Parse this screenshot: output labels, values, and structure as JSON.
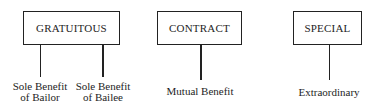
{
  "categories": [
    {
      "title": "GRATUITOUS",
      "branches": [
        {
          "line1": "Sole Benefit",
          "line2": "of Bailor"
        },
        {
          "line1": "Sole Benefit",
          "line2": "of Bailee"
        }
      ]
    },
    {
      "title": "CONTRACT",
      "branches": [
        {
          "line1": "Mutual Benefit"
        }
      ]
    },
    {
      "title": "SPECIAL",
      "branches": [
        {
          "line1": "Extraordinary"
        }
      ]
    }
  ]
}
